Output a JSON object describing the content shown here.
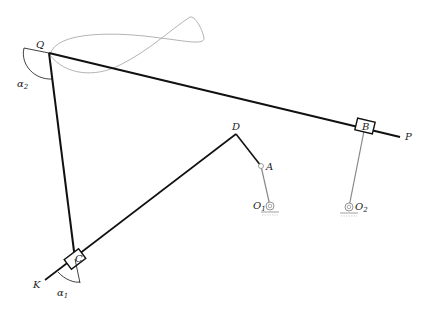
{
  "diagram": {
    "type": "linkage mechanism",
    "points": {
      "Q": {
        "label": "Q",
        "x": 49,
        "y": 53
      },
      "P": {
        "label": "P",
        "x": 400,
        "y": 137
      },
      "B": {
        "label": "B",
        "x": 365,
        "y": 126
      },
      "O2": {
        "label": "O",
        "sub": "2",
        "x": 349,
        "y": 207
      },
      "D": {
        "label": "D",
        "x": 236,
        "y": 134
      },
      "A": {
        "label": "A",
        "x": 261,
        "y": 166
      },
      "O1": {
        "label": "O",
        "sub": "1",
        "x": 270,
        "y": 206
      },
      "C": {
        "label": "C",
        "x": 75,
        "y": 259
      },
      "K": {
        "label": "K",
        "x": 45,
        "y": 280
      }
    },
    "angles": {
      "alpha1": {
        "label": "α",
        "sub": "1"
      },
      "alpha2": {
        "label": "α",
        "sub": "2"
      }
    },
    "colors": {
      "link": "#111111",
      "grey_link": "#888888",
      "curve": "#aaaaaa"
    }
  }
}
